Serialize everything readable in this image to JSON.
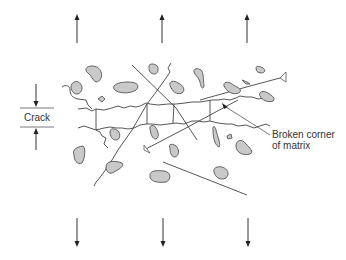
{
  "diagram": {
    "labels": {
      "crack": "Crack",
      "broken_corner_line1": "Broken corner",
      "broken_corner_line2": "of matrix"
    },
    "load_arrows": {
      "top_direction": "up",
      "bottom_direction": "down",
      "count_per_side": 3
    },
    "colors": {
      "particle_fill": "#c9c9c9",
      "line": "#444444",
      "background": "#ffffff"
    }
  }
}
